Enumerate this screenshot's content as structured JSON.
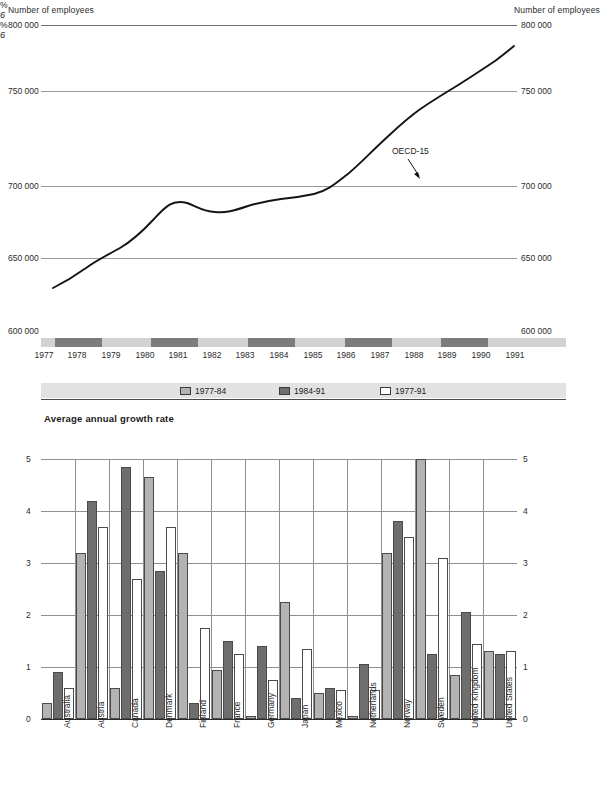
{
  "line_header": {
    "left_title": "Number of employees",
    "right_title": "Number of employees",
    "left_top_value": "800 000",
    "right_top_value": "800 000"
  },
  "line_axis_labels": {
    "left": [
      "800 000",
      "750 000",
      "700 000",
      "650 000",
      "600 000"
    ],
    "right": [
      "800 000",
      "750 000",
      "700 000",
      "650 000",
      "600 000"
    ]
  },
  "annotation": {
    "label": "OECD-15"
  },
  "legend": {
    "items": [
      {
        "label": "1977-84",
        "swatch": "light"
      },
      {
        "label": "1984-91",
        "swatch": "dark"
      },
      {
        "label": "1977-91",
        "swatch": "white"
      }
    ],
    "pct_left": "%",
    "pct_right": "%",
    "six_left": "6",
    "six_right": "6"
  },
  "bar_title": "Average annual growth rate",
  "chart_data": [
    {
      "type": "line",
      "title": "Number of employees",
      "xlabel": "",
      "ylabel": "Number of employees",
      "ylim": [
        600000,
        800000
      ],
      "yticks": [
        600000,
        650000,
        700000,
        750000,
        800000
      ],
      "ytick_labels": [
        "600 000",
        "650 000",
        "700 000",
        "750 000",
        "800 000"
      ],
      "grid": true,
      "legend_position": "inline-annotation",
      "x": [
        1977,
        1978,
        1979,
        1980,
        1981,
        1982,
        1983,
        1984,
        1985,
        1986,
        1987,
        1988,
        1989,
        1990,
        1991
      ],
      "xtick_labels": [
        "1977",
        "1978",
        "1979",
        "1980",
        "1981",
        "1982",
        "1983",
        "1984",
        "1985",
        "1986",
        "1987",
        "1988",
        "1989",
        "1990",
        "1991"
      ],
      "series": [
        {
          "name": "OECD-15",
          "values": [
            637000,
            644000,
            650000,
            663000,
            686000,
            683000,
            683000,
            687000,
            687000,
            691000,
            700000,
            714000,
            730000,
            742000,
            757000
          ]
        }
      ],
      "annotations": [
        {
          "text": "OECD-15",
          "x": 1986.5,
          "y": 708000,
          "points_to_x": 1987.2,
          "points_to_y": 700000
        }
      ]
    },
    {
      "type": "bar",
      "title": "Average annual growth rate",
      "xlabel": "",
      "ylabel": "%",
      "ylim": [
        0,
        6
      ],
      "yticks": [
        0,
        1,
        2,
        3,
        4,
        5,
        6
      ],
      "ytick_labels": [
        "0",
        "1",
        "2",
        "3",
        "4",
        "5",
        "6"
      ],
      "grid": true,
      "legend_position": "top",
      "categories": [
        "Australia",
        "Austria",
        "Canada",
        "Denmark",
        "Finland",
        "France",
        "Germany",
        "Japan",
        "Mexico",
        "Netherlands",
        "Norway",
        "Sweden",
        "United Kingdom",
        "United States"
      ],
      "series": [
        {
          "name": "1977-84",
          "color": "#b3b3b3",
          "values": [
            0.3,
            3.2,
            0.6,
            4.65,
            3.2,
            0.95,
            0.05,
            2.25,
            0.5,
            0.05,
            3.2,
            5.0,
            0.85,
            1.3
          ]
        },
        {
          "name": "1984-91",
          "color": "#6e6e6e",
          "values": [
            0.9,
            4.2,
            4.85,
            2.85,
            0.3,
            1.5,
            1.4,
            0.4,
            0.6,
            1.05,
            3.8,
            1.25,
            2.05,
            1.25
          ]
        },
        {
          "name": "1977-91",
          "color": "#ffffff",
          "values": [
            0.6,
            3.7,
            2.7,
            3.7,
            1.75,
            1.25,
            0.75,
            1.35,
            0.55,
            0.55,
            3.5,
            3.1,
            1.45,
            1.3
          ]
        }
      ]
    }
  ]
}
